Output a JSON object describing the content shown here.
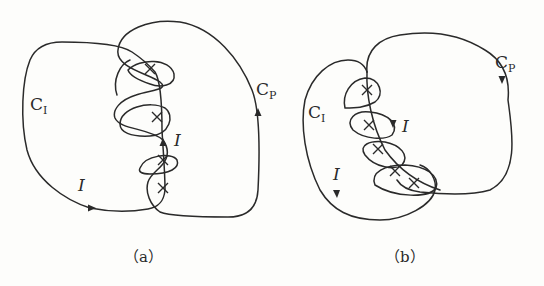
{
  "figure": {
    "panels": [
      {
        "id": "a",
        "caption": "（a）",
        "contour_inner": {
          "name": "C",
          "subscript": "I"
        },
        "contour_outer": {
          "name": "C",
          "subscript": "P"
        },
        "current_labels": [
          "I",
          "I"
        ],
        "pole_count": 4
      },
      {
        "id": "b",
        "caption": "（b）",
        "contour_inner": {
          "name": "C",
          "subscript": "I"
        },
        "contour_outer": {
          "name": "C",
          "subscript": "P"
        },
        "current_labels": [
          "I",
          "I"
        ],
        "pole_count": 5
      }
    ],
    "colors": {
      "ink": "#2a2a2a",
      "background": "#fdfdfb"
    }
  }
}
